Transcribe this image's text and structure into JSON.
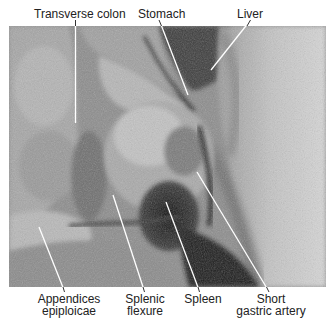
{
  "figure": {
    "type": "labeled anatomical photograph (grayscale dissection)",
    "labels_top": [
      {
        "id": "transverse-colon",
        "text": "Transverse colon"
      },
      {
        "id": "stomach",
        "text": "Stomach"
      },
      {
        "id": "liver",
        "text": "Liver"
      }
    ],
    "labels_bottom": [
      {
        "id": "appendices-epiploicae",
        "line1": "Appendices",
        "line2": "epiploicae"
      },
      {
        "id": "splenic-flexure",
        "line1": "Splenic",
        "line2": "flexure"
      },
      {
        "id": "spleen",
        "line1": "Spleen",
        "line2": ""
      },
      {
        "id": "short-gastric-artery",
        "line1": "Short",
        "line2": "gastric artery"
      }
    ],
    "colors": {
      "label_text": "#222222",
      "leader_line": "#ffffff",
      "background": "#ffffff"
    }
  }
}
